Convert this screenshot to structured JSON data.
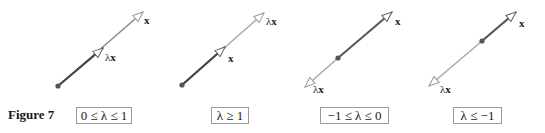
{
  "figure": {
    "label": "Figure 7",
    "colors": {
      "x_vector": "#555555",
      "lambda_vector": "#a9a9a9",
      "origin": "#555555",
      "box_border": "#9a9a9a"
    },
    "panels": [
      {
        "condition": "0 ≤ λ ≤ 1",
        "x_label": "x",
        "lambda_label": "λ",
        "lambda_vec_label": "x",
        "origin": [
          58,
          86
        ],
        "x_tip": [
          143,
          12
        ],
        "lambda_tip": [
          103,
          48
        ]
      },
      {
        "condition": "λ ≥ 1",
        "x_label": "x",
        "lambda_label": "λ",
        "lambda_vec_label": "x",
        "origin": [
          182,
          85
        ],
        "x_tip": [
          225,
          47
        ],
        "lambda_tip": [
          264,
          13
        ]
      },
      {
        "condition": "−1 ≤ λ ≤ 0",
        "x_label": "x",
        "lambda_label": "λ",
        "lambda_vec_label": "x",
        "origin": [
          338,
          58
        ],
        "x_tip": [
          392,
          12
        ],
        "lambda_tip": [
          305,
          87
        ]
      },
      {
        "condition": "λ ≤ −1",
        "x_label": "x",
        "lambda_label": "λ",
        "lambda_vec_label": "x",
        "origin": [
          482,
          41
        ],
        "x_tip": [
          516,
          12
        ],
        "lambda_tip": [
          429,
          86
        ]
      }
    ]
  }
}
